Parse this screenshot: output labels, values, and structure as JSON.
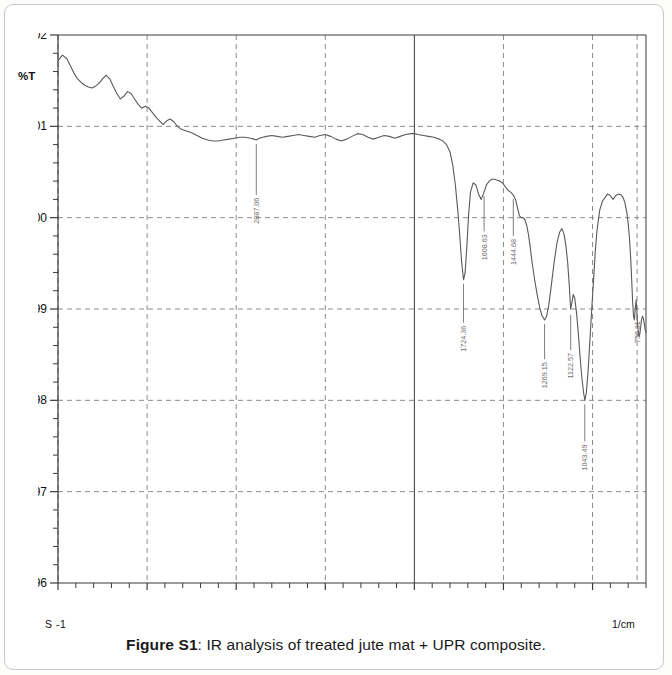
{
  "caption": {
    "prefix": "Figure S1",
    "text": ": IR analysis of treated jute mat + UPR composite."
  },
  "axes": {
    "y_label": "%T",
    "x_unit": "1/cm",
    "x_sub_label": "S -1",
    "y_ticks": [
      "96",
      "97",
      "98",
      "99",
      "100",
      "101",
      "102"
    ],
    "x_ticks": [
      "4000",
      "3500",
      "3000",
      "2500",
      "2000",
      "1500",
      "1000"
    ]
  },
  "colors": {
    "curve": "#5a5a5a",
    "axis": "#3a3a3a",
    "grid": "#8a8a8a",
    "label_text": "#6e6e6e",
    "card_border": "#c9c9c6",
    "background": "#ffffff"
  },
  "chart_data": {
    "type": "line",
    "title": "IR analysis of treated jute mat + UPR composite",
    "xlabel": "1/cm",
    "ylabel": "%T",
    "xlim": [
      4000,
      700
    ],
    "ylim": [
      96,
      102
    ],
    "x_reversed": true,
    "grid": true,
    "grid_style": "dashed",
    "legend": "none",
    "x_major_ticks": [
      4000,
      3500,
      3000,
      2500,
      2000,
      1500,
      1000
    ],
    "y_major_ticks": [
      96,
      97,
      98,
      99,
      100,
      101,
      102
    ],
    "solid_vertical_line_at": 2000,
    "annotations": [
      {
        "label": "2887.06",
        "x": 2887.06,
        "y": 100.85,
        "text_y": 100.25
      },
      {
        "label": "1724.36",
        "x": 1724.36,
        "y": 99.32,
        "text_y": 98.85
      },
      {
        "label": "1608.63",
        "x": 1608.63,
        "y": 100.28,
        "text_y": 99.85
      },
      {
        "label": "1444.68",
        "x": 1444.68,
        "y": 100.25,
        "text_y": 99.8
      },
      {
        "label": "1269.15",
        "x": 1269.15,
        "y": 98.88,
        "text_y": 98.45
      },
      {
        "label": "1122.57",
        "x": 1122.57,
        "y": 98.98,
        "text_y": 98.55
      },
      {
        "label": "1043.49",
        "x": 1043.49,
        "y": 98.0,
        "text_y": 97.55
      },
      {
        "label": "750.31",
        "x": 750.31,
        "y": 98.92,
        "text_y": 98.9
      }
    ],
    "x": [
      4000,
      3975,
      3950,
      3930,
      3910,
      3890,
      3870,
      3850,
      3830,
      3810,
      3790,
      3770,
      3750,
      3730,
      3710,
      3690,
      3670,
      3650,
      3630,
      3610,
      3590,
      3570,
      3550,
      3530,
      3510,
      3490,
      3470,
      3450,
      3430,
      3410,
      3390,
      3370,
      3350,
      3330,
      3310,
      3280,
      3250,
      3220,
      3190,
      3160,
      3130,
      3100,
      3070,
      3040,
      3010,
      2980,
      2950,
      2920,
      2900,
      2887,
      2870,
      2850,
      2830,
      2800,
      2770,
      2740,
      2710,
      2680,
      2650,
      2620,
      2590,
      2560,
      2530,
      2500,
      2470,
      2440,
      2410,
      2380,
      2350,
      2320,
      2290,
      2260,
      2230,
      2200,
      2170,
      2140,
      2110,
      2080,
      2050,
      2020,
      2000,
      1980,
      1950,
      1920,
      1890,
      1860,
      1840,
      1820,
      1800,
      1785,
      1770,
      1755,
      1745,
      1735,
      1724,
      1715,
      1705,
      1695,
      1685,
      1670,
      1655,
      1640,
      1625,
      1609,
      1595,
      1580,
      1565,
      1550,
      1535,
      1520,
      1505,
      1490,
      1475,
      1460,
      1445,
      1432,
      1420,
      1410,
      1400,
      1390,
      1380,
      1370,
      1360,
      1350,
      1340,
      1325,
      1310,
      1295,
      1282,
      1269,
      1258,
      1245,
      1230,
      1215,
      1200,
      1185,
      1172,
      1160,
      1150,
      1140,
      1130,
      1123,
      1115,
      1108,
      1100,
      1090,
      1080,
      1070,
      1060,
      1050,
      1043,
      1035,
      1025,
      1015,
      1005,
      995,
      985,
      975,
      960,
      945,
      930,
      915,
      900,
      885,
      870,
      855,
      840,
      828,
      818,
      808,
      800,
      793,
      786,
      780,
      775,
      770,
      765,
      760,
      755,
      750,
      745,
      740,
      735,
      730,
      725,
      720,
      715,
      710,
      705,
      700
    ],
    "y": [
      101.72,
      101.78,
      101.74,
      101.66,
      101.58,
      101.52,
      101.48,
      101.45,
      101.43,
      101.42,
      101.44,
      101.47,
      101.52,
      101.56,
      101.52,
      101.44,
      101.36,
      101.3,
      101.33,
      101.38,
      101.36,
      101.3,
      101.24,
      101.2,
      101.22,
      101.2,
      101.15,
      101.1,
      101.06,
      101.02,
      101.06,
      101.08,
      101.05,
      101.0,
      100.97,
      100.95,
      100.93,
      100.9,
      100.87,
      100.85,
      100.84,
      100.84,
      100.85,
      100.86,
      100.87,
      100.88,
      100.88,
      100.87,
      100.86,
      100.85,
      100.87,
      100.88,
      100.89,
      100.9,
      100.89,
      100.88,
      100.89,
      100.9,
      100.91,
      100.9,
      100.89,
      100.88,
      100.9,
      100.91,
      100.89,
      100.86,
      100.84,
      100.86,
      100.89,
      100.92,
      100.91,
      100.88,
      100.86,
      100.88,
      100.9,
      100.89,
      100.87,
      100.89,
      100.91,
      100.92,
      100.92,
      100.91,
      100.9,
      100.89,
      100.88,
      100.86,
      100.84,
      100.8,
      100.72,
      100.58,
      100.36,
      100.05,
      99.8,
      99.52,
      99.32,
      99.4,
      99.7,
      100.05,
      100.28,
      100.38,
      100.36,
      100.26,
      100.2,
      100.28,
      100.36,
      100.4,
      100.42,
      100.42,
      100.41,
      100.4,
      100.38,
      100.34,
      100.3,
      100.28,
      100.25,
      100.2,
      100.1,
      100.02,
      100.0,
      100.0,
      99.98,
      99.92,
      99.82,
      99.68,
      99.52,
      99.32,
      99.15,
      99.0,
      98.92,
      98.88,
      98.92,
      99.05,
      99.28,
      99.52,
      99.72,
      99.84,
      99.88,
      99.82,
      99.7,
      99.52,
      99.24,
      99.0,
      99.08,
      99.16,
      99.12,
      98.96,
      98.74,
      98.48,
      98.25,
      98.08,
      98.0,
      98.08,
      98.32,
      98.65,
      98.98,
      99.3,
      99.62,
      99.86,
      100.08,
      100.18,
      100.22,
      100.26,
      100.24,
      100.2,
      100.24,
      100.26,
      100.25,
      100.22,
      100.16,
      100.06,
      99.94,
      99.78,
      99.56,
      99.3,
      99.08,
      98.92,
      98.88,
      99.02,
      99.1,
      98.92,
      98.78,
      98.7,
      98.72,
      98.8,
      98.88,
      98.92,
      98.9,
      98.84,
      98.78,
      98.74
    ]
  }
}
